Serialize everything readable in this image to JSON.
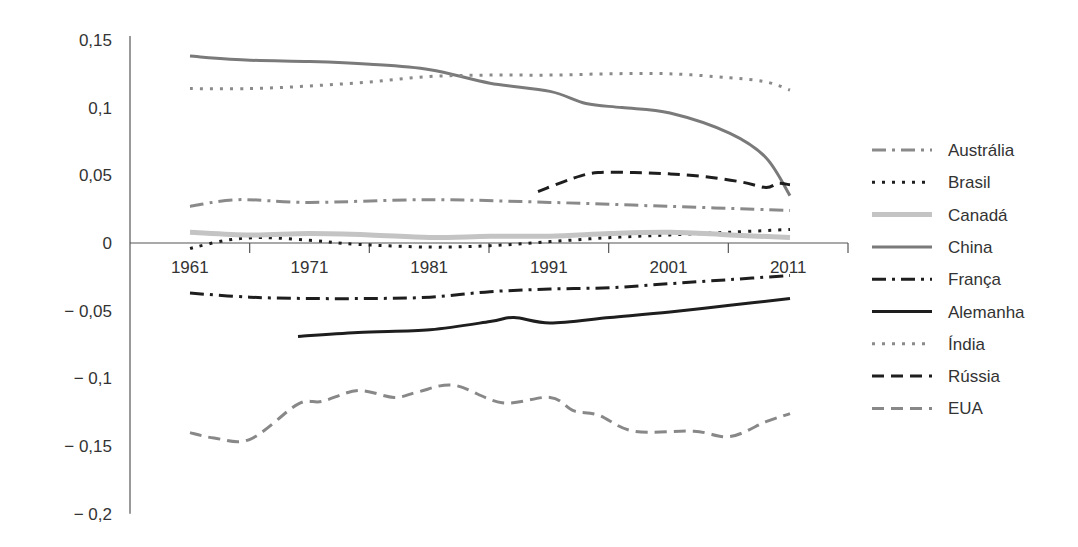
{
  "chart_data": {
    "type": "line",
    "title": "",
    "xlabel": "",
    "ylabel": "",
    "ylim": [
      -0.2,
      0.15
    ],
    "yticks": [
      0.15,
      0.1,
      0.05,
      0,
      -0.05,
      -0.1,
      -0.15,
      -0.2
    ],
    "ytick_labels": [
      "0,15",
      "0,1",
      "0,05",
      "0",
      "− 0,05",
      "− 0,1",
      "− 0,15",
      "− 0,2"
    ],
    "xticks": [
      1961,
      1971,
      1981,
      1991,
      2001,
      2011
    ],
    "xtick_labels": [
      "1961",
      "1971",
      "1981",
      "1991",
      "2001",
      "2011"
    ],
    "xlim": [
      1961,
      2011
    ],
    "grid": false,
    "legend_position": "right",
    "series": [
      {
        "name": "Austrália",
        "style": "dashdot",
        "color": "#8a8a8a",
        "width": 3,
        "x": [
          1961,
          1965,
          1971,
          1981,
          1991,
          2001,
          2011
        ],
        "values": [
          0.027,
          0.032,
          0.03,
          0.032,
          0.03,
          0.027,
          0.024
        ]
      },
      {
        "name": "Brasil",
        "style": "dotted",
        "color": "#1e1e1e",
        "width": 3,
        "x": [
          1961,
          1964,
          1967,
          1971,
          1975,
          1981,
          1986,
          1991,
          1996,
          2001,
          2006,
          2011
        ],
        "values": [
          -0.004,
          0.002,
          0.004,
          0.002,
          -0.001,
          -0.003,
          -0.002,
          0.001,
          0.004,
          0.006,
          0.008,
          0.01
        ]
      },
      {
        "name": "Canadá",
        "style": "solid",
        "color": "#c4c4c4",
        "width": 5,
        "x": [
          1961,
          1966,
          1971,
          1976,
          1981,
          1986,
          1991,
          1996,
          2001,
          2006,
          2011
        ],
        "values": [
          0.008,
          0.006,
          0.007,
          0.006,
          0.004,
          0.005,
          0.005,
          0.007,
          0.008,
          0.006,
          0.004
        ]
      },
      {
        "name": "China",
        "style": "solid",
        "color": "#7a7a7a",
        "width": 3,
        "x": [
          1961,
          1966,
          1971,
          1976,
          1981,
          1986,
          1991,
          1994,
          1997,
          2001,
          2006,
          2009,
          2011
        ],
        "values": [
          0.138,
          0.135,
          0.134,
          0.132,
          0.128,
          0.118,
          0.112,
          0.103,
          0.1,
          0.096,
          0.081,
          0.063,
          0.035
        ]
      },
      {
        "name": "França",
        "style": "dashdot",
        "color": "#1e1e1e",
        "width": 3,
        "x": [
          1961,
          1966,
          1971,
          1976,
          1981,
          1986,
          1991,
          1996,
          2001,
          2006,
          2011
        ],
        "values": [
          -0.037,
          -0.04,
          -0.041,
          -0.041,
          -0.04,
          -0.036,
          -0.034,
          -0.033,
          -0.03,
          -0.027,
          -0.024
        ]
      },
      {
        "name": "Alemanha",
        "style": "solid",
        "color": "#1e1e1e",
        "width": 3,
        "x": [
          1970,
          1975,
          1981,
          1986,
          1988,
          1991,
          1996,
          2001,
          2006,
          2011
        ],
        "values": [
          -0.069,
          -0.066,
          -0.064,
          -0.058,
          -0.055,
          -0.059,
          -0.055,
          -0.051,
          -0.046,
          -0.041
        ]
      },
      {
        "name": "Índia",
        "style": "dotted",
        "color": "#8a8a8a",
        "width": 3,
        "x": [
          1961,
          1966,
          1971,
          1976,
          1981,
          1986,
          1991,
          1996,
          2001,
          2006,
          2009,
          2011
        ],
        "values": [
          0.114,
          0.114,
          0.116,
          0.119,
          0.123,
          0.124,
          0.124,
          0.125,
          0.125,
          0.122,
          0.119,
          0.113
        ]
      },
      {
        "name": "Rússia",
        "style": "dashed",
        "color": "#1e1e1e",
        "width": 3,
        "x": [
          1990,
          1993,
          1995,
          1998,
          2001,
          2004,
          2007,
          2009,
          2010,
          2011
        ],
        "values": [
          0.038,
          0.048,
          0.052,
          0.052,
          0.051,
          0.049,
          0.045,
          0.041,
          0.044,
          0.043
        ]
      },
      {
        "name": "EUA",
        "style": "dashed",
        "color": "#888888",
        "width": 3,
        "x": [
          1961,
          1963,
          1966,
          1970,
          1972,
          1975,
          1978,
          1980,
          1983,
          1987,
          1991,
          1993,
          1995,
          1998,
          2003,
          2006,
          2009,
          2011
        ],
        "values": [
          -0.14,
          -0.144,
          -0.145,
          -0.119,
          -0.117,
          -0.109,
          -0.114,
          -0.11,
          -0.105,
          -0.118,
          -0.114,
          -0.124,
          -0.127,
          -0.139,
          -0.139,
          -0.143,
          -0.132,
          -0.126
        ]
      }
    ]
  }
}
